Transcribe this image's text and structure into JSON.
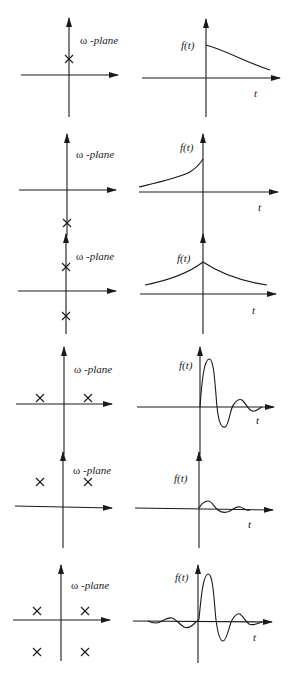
{
  "labels": {
    "plane_omega": "ω",
    "plane_suffix": " -plane",
    "function": "f(t)",
    "time": "t"
  },
  "colors": {
    "ink": "#1a1a1a",
    "background": "#ffffff"
  },
  "rows": [
    {
      "id": "row-1",
      "description": "single pole on positive imaginary axis -> decaying exponential for t>0",
      "poles": [
        [
          0,
          1
        ]
      ],
      "response": "decaying exponential, t > 0 only"
    },
    {
      "id": "row-2",
      "description": "single pole on negative imaginary axis -> growing exponential for t<0",
      "poles": [
        [
          0,
          -1
        ]
      ],
      "response": "growing exponential, t < 0 only"
    },
    {
      "id": "row-3",
      "description": "poles at +i and -i -> two-sided exponential",
      "poles": [
        [
          0,
          1
        ],
        [
          0,
          -1
        ]
      ],
      "response": "two-sided decaying exponential peaked at t = 0"
    },
    {
      "id": "row-4",
      "description": "two poles in upper half plane -> causal damped oscillation",
      "poles": [
        [
          -1,
          0.3
        ],
        [
          1,
          0.3
        ]
      ],
      "response": "causal damped oscillation (large amplitude)"
    },
    {
      "id": "row-5",
      "description": "two poles higher in upper half plane -> weak causal damped oscillation",
      "poles": [
        [
          -1,
          1
        ],
        [
          1,
          1
        ]
      ],
      "response": "causal damped oscillation (small amplitude)"
    },
    {
      "id": "row-6",
      "description": "four poles symmetric in both half planes -> two-sided oscillation",
      "poles": [
        [
          -1,
          0.4
        ],
        [
          1,
          0.4
        ],
        [
          -1,
          -1
        ],
        [
          1,
          -1
        ]
      ],
      "response": "two-sided damped oscillation with main pulse after t = 0"
    }
  ]
}
